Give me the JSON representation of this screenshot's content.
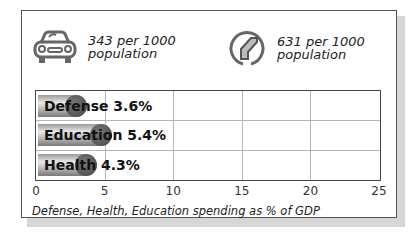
{
  "stats": [
    {
      "icon": "car-icon",
      "value": "343 per 1000",
      "unit": "population"
    },
    {
      "icon": "road-icon",
      "value": "631 per 1000",
      "unit": "population"
    }
  ],
  "chart_data": {
    "type": "bar",
    "orientation": "horizontal",
    "categories": [
      "Defense",
      "Education",
      "Health"
    ],
    "values": [
      3.6,
      5.4,
      4.3
    ],
    "labels": [
      "Defense 3.6%",
      "Education 5.4%",
      "Health 4.3%"
    ],
    "title": "",
    "xlabel": "Defense, Health, Education spending as % of GDP",
    "ylabel": "",
    "xlim": [
      0,
      25
    ],
    "xticks": [
      "0",
      "5",
      "10",
      "15",
      "20",
      "25"
    ],
    "grid": true,
    "legend": null
  },
  "colors": {
    "bar": "#9a9a9a",
    "bar_cap": "#555555",
    "border": "#444444",
    "grid": "#b5b5b5"
  }
}
